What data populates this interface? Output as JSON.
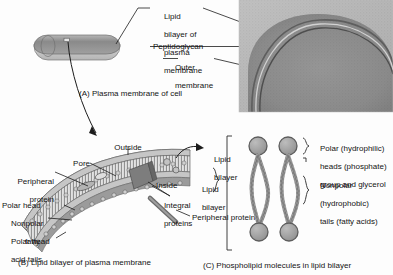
{
  "figure": {
    "panels": [
      {
        "id": "A",
        "caption": "(A) Plasma membrane of cell"
      },
      {
        "id": "B",
        "caption": "(B) Lipid bilayer of plasma membrane"
      },
      {
        "id": "C",
        "caption": "(C) Phospholipid molecules in lipid bilayer"
      }
    ]
  },
  "panelA": {
    "caption": "(A) Plasma membrane of cell",
    "labels": [
      {
        "name": "lipid-bilayer-of-plasma-membrane",
        "lines": [
          "Lipid",
          "bilayer of",
          "plasma",
          "membrane"
        ]
      },
      {
        "name": "peptidoglycan",
        "text": "Peptidoglycan"
      },
      {
        "name": "outer-membrane",
        "lines": [
          "Outer",
          "membrane"
        ]
      }
    ],
    "cell_shape": "rod-shaped bacterium",
    "micrograph": "electron micrograph of bacterial cell envelope"
  },
  "panelB": {
    "caption": "(B) Lipid bilayer of plasma membrane",
    "labels": [
      {
        "name": "outside",
        "text": "Outside"
      },
      {
        "name": "pore",
        "text": "Pore"
      },
      {
        "name": "peripheral-protein-top",
        "lines": [
          "Peripheral",
          "protein"
        ]
      },
      {
        "name": "polar-head-top",
        "text": "Polar head"
      },
      {
        "name": "nonpolar-fatty-acid-tails",
        "lines": [
          "Nonpolar",
          "fatty",
          "acid tails"
        ]
      },
      {
        "name": "polar-head-bottom",
        "text": "Polar head"
      },
      {
        "name": "inside",
        "text": "Inside"
      },
      {
        "name": "integral-proteins",
        "lines": [
          "Integral",
          "proteins"
        ]
      },
      {
        "name": "peripheral-protein-bottom",
        "text": "Peripheral protein"
      },
      {
        "name": "lipid-bilayer-upper",
        "lines": [
          "Lipid",
          "bilayer"
        ]
      },
      {
        "name": "lipid-bilayer-lower",
        "lines": [
          "Lipid",
          "bilayer"
        ]
      }
    ]
  },
  "panelC": {
    "caption": "(C) Phospholipid molecules in lipid bilayer",
    "labels": [
      {
        "name": "polar-hydrophilic-heads",
        "lines": [
          "Polar (hydrophilic)",
          "heads (phosphate)",
          "group and glycerol"
        ]
      },
      {
        "name": "nonpolar-hydrophobic-tails",
        "lines": [
          "Nonpolar",
          "(hydrophobic)",
          "tails (fatty acids)"
        ]
      }
    ],
    "molecule_count": 2
  },
  "text": {
    "a_lipid_1": "Lipid",
    "a_lipid_2": "bilayer of",
    "a_lipid_3": "plasma",
    "a_lipid_4": "membrane",
    "a_peptidoglycan": "Peptidoglycan",
    "a_outer_1": "Outer",
    "a_outer_2": "membrane",
    "a_caption": "(A) Plasma membrane of cell",
    "b_outside": "Outside",
    "b_pore": "Pore",
    "b_periph_1": "Peripheral",
    "b_periph_2": "protein",
    "b_polar_head_top": "Polar head",
    "b_nonpolar_1": "Nonpolar",
    "b_nonpolar_2": "fatty",
    "b_nonpolar_3": "acid tails",
    "b_polar_head_bottom": "Polar head",
    "b_inside": "Inside",
    "b_integral_1": "Integral",
    "b_integral_2": "proteins",
    "b_periph_bottom": "Peripheral protein",
    "b_lipid_up_1": "Lipid",
    "b_lipid_up_2": "bilayer",
    "b_lipid_lo_1": "Lipid",
    "b_lipid_lo_2": "bilayer",
    "b_caption": "(B) Lipid bilayer of plasma membrane",
    "c_polar_1": "Polar (hydrophilic)",
    "c_polar_2": "heads (phosphate)",
    "c_polar_3": "group and glycerol",
    "c_nonpolar_1": "Nonpolar",
    "c_nonpolar_2": "(hydrophobic)",
    "c_nonpolar_3": "tails (fatty acids)",
    "c_caption": "(C) Phospholipid molecules in lipid bilayer"
  },
  "colors": {
    "ink": "#141414",
    "cell_top": "#8d8d8d",
    "cell_bottom": "#c9c9c9",
    "membrane_gray": "#9a9a9a",
    "head_gray": "#a5a5a5",
    "micrograph_dark": "#6f6f6f",
    "micrograph_light": "#c2c2c2"
  }
}
